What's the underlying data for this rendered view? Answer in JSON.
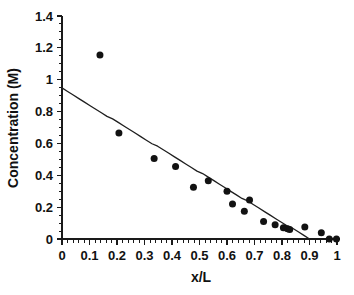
{
  "chart_data": {
    "type": "scatter",
    "title": "",
    "xlabel": "x/L",
    "ylabel": "Concentration (M)",
    "xlim": [
      0,
      1
    ],
    "ylim": [
      0,
      1.4
    ],
    "grid": false,
    "legend": null,
    "x_ticks": [
      "0",
      "0.1",
      "0.2",
      "0.3",
      "0.4",
      "0.5",
      "0.6",
      "0.7",
      "0.8",
      "0.9",
      "1"
    ],
    "x_tick_values": [
      0,
      0.1,
      0.2,
      0.3,
      0.4,
      0.5,
      0.6,
      0.7,
      0.8,
      0.9,
      1
    ],
    "y_ticks": [
      "0",
      "0.2",
      "0.4",
      "0.6",
      "0.8",
      "1",
      "1.2",
      "1.4"
    ],
    "y_tick_values": [
      0,
      0.2,
      0.4,
      0.6,
      0.8,
      1,
      1.2,
      1.4
    ],
    "x_minor_interval": 0.02,
    "y_minor_interval": 0.05,
    "series": [
      {
        "name": "measured concentration",
        "type": "scatter",
        "marker": "filled-circle",
        "marker_size_px": 7,
        "color": "#121212",
        "points": [
          [
            0.138,
            1.155
          ],
          [
            0.207,
            0.665
          ],
          [
            0.335,
            0.505
          ],
          [
            0.413,
            0.455
          ],
          [
            0.478,
            0.325
          ],
          [
            0.532,
            0.365
          ],
          [
            0.6,
            0.3
          ],
          [
            0.62,
            0.22
          ],
          [
            0.663,
            0.175
          ],
          [
            0.682,
            0.245
          ],
          [
            0.733,
            0.11
          ],
          [
            0.775,
            0.09
          ],
          [
            0.805,
            0.07
          ],
          [
            0.82,
            0.065
          ],
          [
            0.828,
            0.06
          ],
          [
            0.883,
            0.075
          ],
          [
            0.943,
            0.04
          ],
          [
            0.972,
            0.0
          ],
          [
            0.998,
            0.0
          ]
        ]
      },
      {
        "name": "linear trend line",
        "type": "line",
        "color": "#1f1f1f",
        "points": [
          [
            0.0,
            0.945
          ],
          [
            0.9,
            0.0
          ]
        ],
        "intercept": 0.945,
        "slope": -1.05,
        "x_zero_crossing": 0.9
      }
    ]
  },
  "axes": {
    "y_axis_title": "Concentration (M)",
    "x_axis_title": "x/L"
  }
}
